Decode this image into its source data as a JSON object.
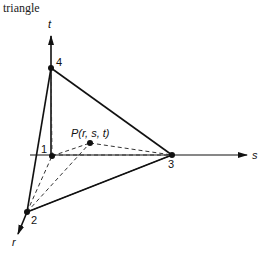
{
  "title": "triangle",
  "axes": {
    "r": "r",
    "s": "s",
    "t": "t"
  },
  "nodes": [
    {
      "id": "1",
      "label": "1",
      "x": 52,
      "y": 156
    },
    {
      "id": "2",
      "label": "2",
      "x": 27,
      "y": 212
    },
    {
      "id": "3",
      "label": "3",
      "x": 172,
      "y": 155
    },
    {
      "id": "4",
      "label": "4",
      "x": 51,
      "y": 68
    }
  ],
  "point": {
    "label": "P(r, s, t)",
    "x": 90,
    "y": 143
  },
  "solid_edges": [
    [
      "4",
      "2"
    ],
    [
      "4",
      "3"
    ],
    [
      "2",
      "3"
    ]
  ],
  "dashed_edges": [
    [
      "1",
      "4"
    ],
    [
      "1",
      "P"
    ],
    [
      "P",
      "3"
    ],
    [
      "1",
      "3"
    ],
    [
      "2",
      "P"
    ],
    [
      "2",
      "1"
    ]
  ],
  "colors": {
    "line": "#111111",
    "background": "#ffffff"
  }
}
